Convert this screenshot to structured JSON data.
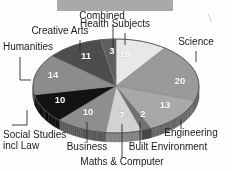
{
  "figure": {
    "background_color": "#fdfdfc",
    "top_banner": {
      "name": "cropped-gray-banner",
      "color": "#a9a9a7",
      "x": 57,
      "y": 0,
      "width": 116,
      "height": 11
    },
    "stray_mark": {
      "name": "stray-pen-mark",
      "glyph": "\\",
      "x": 208,
      "y": 22
    }
  },
  "chart_data": {
    "type": "pie",
    "title": "",
    "subtitle": "",
    "xlabel": "",
    "ylabel": "",
    "units": "percent",
    "total": 100,
    "style": "3d-elliptical-grayscale",
    "grid": false,
    "legend": "none-labels-with-leader-lines",
    "value_label_color": "#ffffff",
    "categories": [
      "Health Subjects",
      "Science",
      "Engineering",
      "Built Environment",
      "Maths & Computer",
      "Business",
      "Social Studies incl Law",
      "Humanities",
      "Creative Arts",
      "Combined"
    ],
    "values": [
      10,
      20,
      13,
      2,
      7,
      10,
      10,
      14,
      11,
      3
    ],
    "colors": [
      "#e8e8e6",
      "#9a9a98",
      "#a8a8a6",
      "#707070",
      "#d2d2d0",
      "#8e8e8c",
      "#121212",
      "#8c8c8a",
      "#4d4d4d",
      "#5e5e5e"
    ],
    "slices": [
      {
        "label": "Health Subjects",
        "value": 10,
        "color": "#e8e8e6",
        "value_x": 125,
        "value_y": 57,
        "label_x": 115,
        "label_y": 27,
        "label_anchor": "middle",
        "leader": [
          [
            125,
            33
          ],
          [
            125,
            45
          ]
        ]
      },
      {
        "label": "Science",
        "value": 20,
        "color": "#9a9a98",
        "value_x": 180,
        "value_y": 84,
        "label_x": 196,
        "label_y": 45,
        "label_anchor": "middle",
        "leader": [
          [
            196,
            51
          ],
          [
            196,
            62
          ]
        ]
      },
      {
        "label": "Engineering",
        "value": 13,
        "color": "#a8a8a6",
        "value_x": 165,
        "value_y": 108,
        "label_x": 191,
        "label_y": 136,
        "label_anchor": "middle",
        "leader": [
          [
            181,
            119
          ],
          [
            181,
            129
          ]
        ]
      },
      {
        "label": "Built Environment",
        "value": 2,
        "color": "#707070",
        "value_x": 143,
        "value_y": 117,
        "label_x": 168,
        "label_y": 150,
        "label_anchor": "middle",
        "leader": [
          [
            140,
            122
          ],
          [
            140,
            144
          ]
        ]
      },
      {
        "label": "Maths & Computer",
        "value": 7,
        "color": "#d2d2d0",
        "value_x": 122,
        "value_y": 118,
        "label_x": 122,
        "label_y": 165,
        "label_anchor": "middle",
        "leader": [
          [
            122,
            124
          ],
          [
            122,
            158
          ]
        ]
      },
      {
        "label": "Business",
        "value": 10,
        "color": "#8e8e8c",
        "value_x": 88,
        "value_y": 115,
        "label_x": 87,
        "label_y": 150,
        "label_anchor": "middle",
        "leader": [
          [
            87,
            122
          ],
          [
            87,
            143
          ]
        ]
      },
      {
        "label": "Social Studies incl Law",
        "value": 10,
        "color": "#121212",
        "value_x": 60,
        "value_y": 103,
        "label_x": 3,
        "label_y": 138,
        "label_anchor": "start",
        "leader": [
          [
            27,
            110
          ],
          [
            27,
            125
          ],
          [
            12,
            125
          ]
        ]
      },
      {
        "label": "Humanities",
        "value": 14,
        "color": "#8c8c8a",
        "value_x": 53,
        "value_y": 78,
        "label_x": 3,
        "label_y": 50,
        "label_anchor": "start",
        "leader": [
          [
            31,
            80
          ],
          [
            20,
            80
          ],
          [
            20,
            57
          ]
        ]
      },
      {
        "label": "Creative Arts",
        "value": 11,
        "color": "#4d4d4d",
        "value_x": 86,
        "value_y": 59,
        "label_x": 60,
        "label_y": 34,
        "label_anchor": "middle",
        "leader": [
          [
            80,
            52
          ],
          [
            80,
            40
          ]
        ]
      },
      {
        "label": "Combined",
        "value": 3,
        "color": "#5e5e5e",
        "value_x": 112,
        "value_y": 54,
        "label_x": 102,
        "label_y": 19,
        "label_anchor": "middle",
        "leader": [
          [
            113,
            48
          ],
          [
            113,
            24
          ]
        ]
      }
    ]
  }
}
